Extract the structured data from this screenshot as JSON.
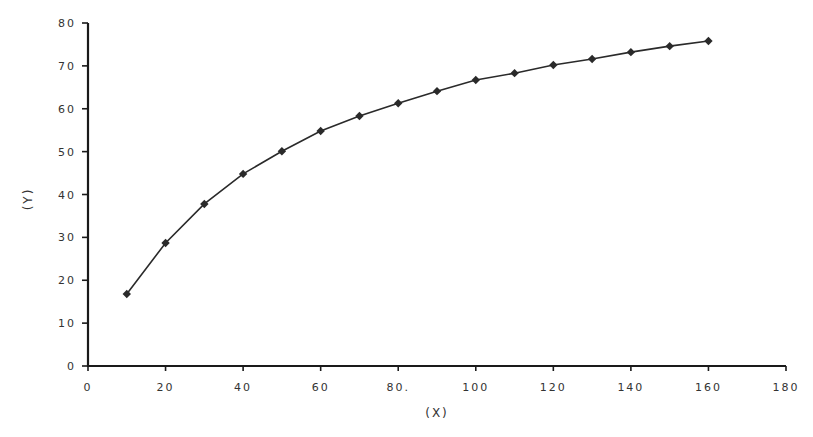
{
  "chart_data": {
    "type": "line",
    "title": "",
    "xlabel": "(X)",
    "ylabel": "(Y)",
    "xlim": [
      0,
      180
    ],
    "ylim": [
      0,
      80
    ],
    "x_ticks": [
      0,
      20,
      40,
      60,
      80,
      100,
      120,
      140,
      160,
      180
    ],
    "x_tick_labels": [
      "0",
      "20",
      "40",
      "60",
      "80.",
      "100",
      "120",
      "140",
      "160",
      "180"
    ],
    "y_ticks": [
      0,
      10,
      20,
      30,
      40,
      50,
      60,
      70,
      80
    ],
    "y_tick_labels": [
      "0",
      "10",
      "20",
      "30",
      "40",
      "50",
      "60",
      "70",
      "80"
    ],
    "grid": false,
    "legend": null,
    "marker": "diamond",
    "series": [
      {
        "name": "Y",
        "x": [
          10,
          20,
          30,
          40,
          50,
          60,
          70,
          80,
          90,
          100,
          110,
          120,
          130,
          140,
          150,
          160
        ],
        "values": [
          16.8,
          28.7,
          37.8,
          44.8,
          50.1,
          54.8,
          58.3,
          61.3,
          64.1,
          66.7,
          68.3,
          70.2,
          71.6,
          73.2,
          74.6,
          75.8
        ]
      }
    ]
  },
  "colors": {
    "line": "#2a2a2a",
    "axis": "#1a1a1a",
    "text": "#333333"
  }
}
